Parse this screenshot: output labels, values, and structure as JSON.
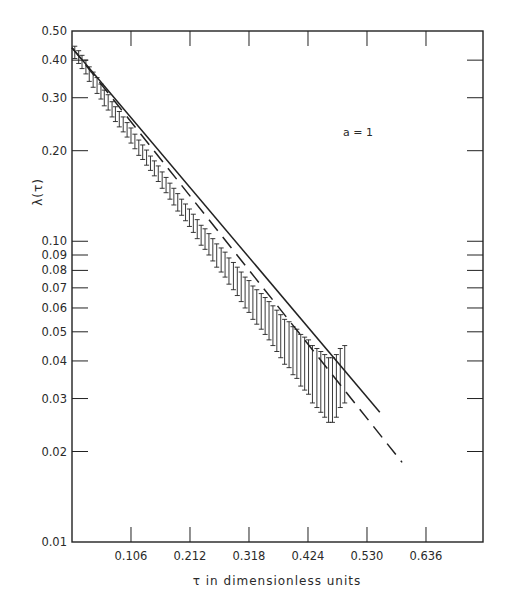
{
  "chart_data": {
    "type": "scatter",
    "title": "",
    "xlabel": "τ  in dimensionless units",
    "ylabel": "λ(τ)",
    "yscale": "log",
    "xlim": [
      0,
      0.735
    ],
    "ylim": [
      0.01,
      0.5
    ],
    "grid": false,
    "annotation": "a = 1",
    "x_ticks": [
      0.106,
      0.212,
      0.318,
      0.424,
      0.53,
      0.636
    ],
    "x_tick_labels": [
      "0.106",
      "0.212",
      "0.318",
      "0.424",
      "0.530",
      "0.636"
    ],
    "y_ticks": [
      0.5,
      0.4,
      0.3,
      0.2,
      0.1,
      0.09,
      0.08,
      0.07,
      0.06,
      0.05,
      0.04,
      0.03,
      0.02,
      0.01
    ],
    "y_tick_labels": [
      "0.50",
      "0.40",
      "0.30",
      "0.20",
      "0.10",
      "0.09",
      "0.08",
      "0.07",
      "0.06",
      "0.05",
      "0.04",
      "0.03",
      "0.02",
      "0.01"
    ],
    "series": [
      {
        "name": "solid fit",
        "style": "solid",
        "x": [
          0.0,
          0.553
        ],
        "y": [
          0.44,
          0.027
        ]
      },
      {
        "name": "dashed fit",
        "style": "dashed",
        "x": [
          0.0,
          0.593
        ],
        "y": [
          0.44,
          0.0184
        ]
      },
      {
        "name": "data with error bars",
        "style": "errorbar",
        "x": [
          0.005,
          0.012,
          0.018,
          0.025,
          0.031,
          0.038,
          0.045,
          0.052,
          0.058,
          0.065,
          0.072,
          0.078,
          0.085,
          0.092,
          0.099,
          0.106,
          0.113,
          0.12,
          0.127,
          0.134,
          0.141,
          0.148,
          0.155,
          0.162,
          0.169,
          0.176,
          0.183,
          0.19,
          0.197,
          0.204,
          0.211,
          0.218,
          0.225,
          0.232,
          0.239,
          0.246,
          0.253,
          0.26,
          0.268,
          0.275,
          0.282,
          0.29,
          0.297,
          0.304,
          0.311,
          0.318,
          0.325,
          0.332,
          0.34,
          0.347,
          0.354,
          0.361,
          0.368,
          0.375,
          0.382,
          0.39,
          0.397,
          0.404,
          0.411,
          0.418,
          0.425,
          0.432,
          0.44,
          0.447,
          0.454,
          0.461,
          0.468,
          0.475,
          0.482,
          0.49
        ],
        "y": [
          0.425,
          0.41,
          0.395,
          0.38,
          0.36,
          0.345,
          0.33,
          0.315,
          0.3,
          0.29,
          0.275,
          0.265,
          0.255,
          0.245,
          0.235,
          0.225,
          0.215,
          0.205,
          0.198,
          0.19,
          0.182,
          0.175,
          0.168,
          0.16,
          0.154,
          0.147,
          0.141,
          0.135,
          0.13,
          0.125,
          0.12,
          0.115,
          0.11,
          0.105,
          0.102,
          0.098,
          0.094,
          0.09,
          0.087,
          0.084,
          0.08,
          0.077,
          0.074,
          0.071,
          0.068,
          0.066,
          0.063,
          0.061,
          0.059,
          0.057,
          0.055,
          0.053,
          0.051,
          0.049,
          0.047,
          0.046,
          0.044,
          0.043,
          0.041,
          0.04,
          0.039,
          0.037,
          0.036,
          0.035,
          0.034,
          0.033,
          0.033,
          0.034,
          0.036,
          0.037
        ],
        "err": [
          0.02,
          0.02,
          0.02,
          0.02,
          0.02,
          0.02,
          0.02,
          0.018,
          0.018,
          0.017,
          0.016,
          0.015,
          0.015,
          0.014,
          0.013,
          0.013,
          0.012,
          0.012,
          0.011,
          0.011,
          0.01,
          0.01,
          0.01,
          0.01,
          0.009,
          0.009,
          0.009,
          0.009,
          0.008,
          0.008,
          0.008,
          0.008,
          0.008,
          0.008,
          0.008,
          0.008,
          0.008,
          0.008,
          0.008,
          0.008,
          0.008,
          0.008,
          0.008,
          0.008,
          0.008,
          0.008,
          0.008,
          0.008,
          0.008,
          0.008,
          0.008,
          0.008,
          0.008,
          0.008,
          0.008,
          0.008,
          0.008,
          0.008,
          0.008,
          0.008,
          0.008,
          0.008,
          0.008,
          0.008,
          0.008,
          0.008,
          0.008,
          0.008,
          0.008,
          0.008
        ]
      }
    ]
  },
  "plot": {
    "frame": {
      "left": 72,
      "top": 31,
      "right": 483,
      "bottom": 542
    },
    "x_px_per_unit": 556.6,
    "y_px_per_decade": 300.8,
    "colors": {
      "ink": "#222222",
      "background": "#ffffff"
    }
  }
}
